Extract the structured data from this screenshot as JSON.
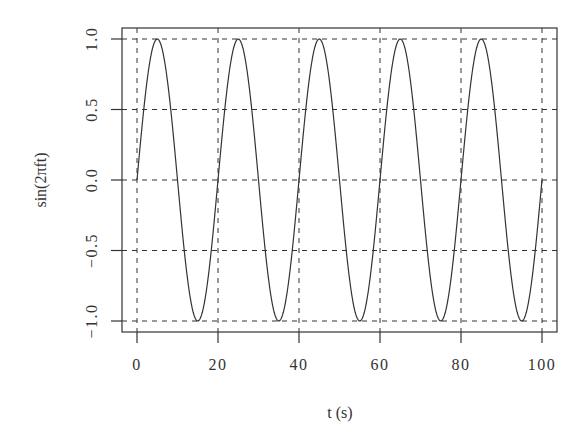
{
  "chart_data": {
    "type": "line",
    "title": "",
    "xlabel": "t (s)",
    "ylabel": "sin(2πft)",
    "xlim": [
      0,
      100
    ],
    "ylim": [
      -1.0,
      1.0
    ],
    "x_ticks": [
      0,
      20,
      40,
      60,
      80,
      100
    ],
    "x_tick_labels": [
      "0",
      "20",
      "40",
      "60",
      "80",
      "100"
    ],
    "y_ticks": [
      -1.0,
      -0.5,
      0.0,
      0.5,
      1.0
    ],
    "y_tick_labels": [
      "−1.0",
      "−0.5",
      "0.0",
      "0.5",
      "1.0"
    ],
    "grid": true,
    "grid_style": "dashed",
    "legend": null,
    "series": [
      {
        "name": "sin(2πft)",
        "function": "sin(2*pi*f*t)",
        "frequency": 0.05,
        "period": 20,
        "x_range": [
          0,
          100
        ],
        "sample_points": {
          "x": [
            0,
            5,
            10,
            15,
            20,
            25,
            30,
            35,
            40,
            45,
            50,
            55,
            60,
            65,
            70,
            75,
            80,
            85,
            90,
            95,
            100
          ],
          "y": [
            0,
            1,
            0,
            -1,
            0,
            1,
            0,
            -1,
            0,
            1,
            0,
            -1,
            0,
            1,
            0,
            -1,
            0,
            1,
            0,
            -1,
            0
          ]
        }
      }
    ]
  },
  "colors": {
    "line": "#333333",
    "grid": "#333333",
    "axes": "#333333",
    "background": "#ffffff"
  }
}
